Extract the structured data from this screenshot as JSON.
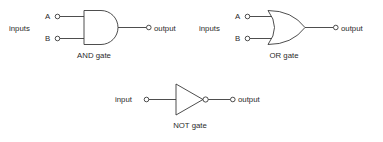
{
  "diagram": {
    "background_color": "#ffffff",
    "stroke_color": "#3a3a3a",
    "text_color": "#2b2b2b",
    "gates": [
      {
        "id": "and",
        "caption": "AND gate",
        "symbol": "and-gate-symbol",
        "inputs_label": "inputs",
        "input_pins": [
          "A",
          "B"
        ],
        "output_label": "output"
      },
      {
        "id": "or",
        "caption": "OR gate",
        "symbol": "or-gate-symbol",
        "inputs_label": "inputs",
        "input_pins": [
          "A",
          "B"
        ],
        "output_label": "output"
      },
      {
        "id": "not",
        "caption": "NOT gate",
        "symbol": "not-gate-symbol",
        "inputs_label": "input",
        "input_pins": [],
        "output_label": "output"
      }
    ]
  }
}
